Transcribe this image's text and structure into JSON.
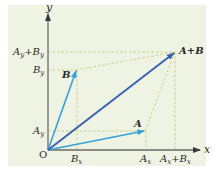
{
  "diagram": {
    "axes": {
      "x_label": "x",
      "y_label": "y",
      "origin_label": "O"
    },
    "vectors": [
      {
        "name": "A",
        "label": "A",
        "tip": [
          145,
          131
        ],
        "color": "#3aa0d8"
      },
      {
        "name": "B",
        "label": "B",
        "tip": [
          76,
          70
        ],
        "color": "#3aa0d8"
      },
      {
        "name": "A+B",
        "label": "A+B",
        "tip": [
          175,
          52
        ],
        "color": "#3a63b0"
      }
    ],
    "x_ticks": [
      {
        "main": "B",
        "sub": "x",
        "x": 77
      },
      {
        "main": "A",
        "sub": "x",
        "x": 146
      },
      {
        "main": "A",
        "sub": "x",
        "plus": "+",
        "main2": "B",
        "sub2": "x",
        "x": 175
      }
    ],
    "y_ticks": [
      {
        "main": "A",
        "sub": "y",
        "plus": "+",
        "main2": "B",
        "sub2": "y",
        "y": 52
      },
      {
        "main": "B",
        "sub": "y",
        "y": 70
      },
      {
        "main": "A",
        "sub": "y",
        "y": 131
      }
    ],
    "colors": {
      "background": "#eef3e4",
      "axis": "#6a6a6a",
      "component_vector": "#3aa0d8",
      "resultant_vector": "#3a63b0",
      "dashed_guides": "#c9cc7a"
    }
  }
}
